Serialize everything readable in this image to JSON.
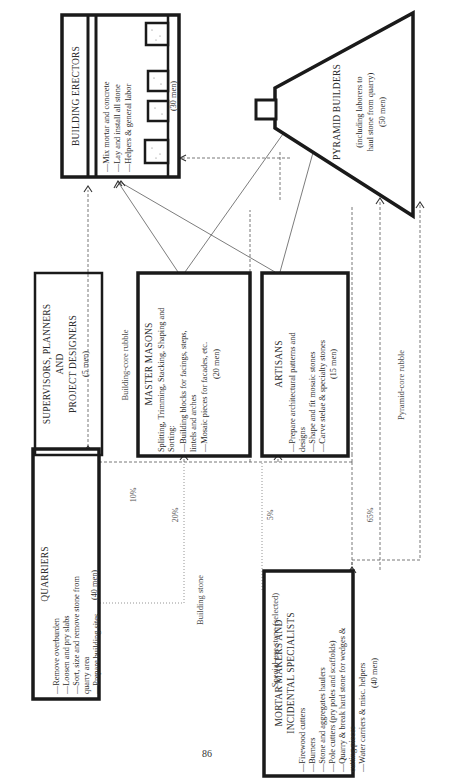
{
  "page_number": "86",
  "boxes": {
    "quarriers": {
      "title": "QUARRIERS",
      "items": [
        "—Remove overburden",
        "—Loosen and pry slabs",
        "—Sort, size and remove stone from",
        "   quarry area",
        "—Prepare building sites"
      ],
      "count": "(40 men)"
    },
    "mortar_makers": {
      "title_line1": "MORTAR MAKERS AND",
      "title_line2": "INCIDENTAL SPECIALISTS",
      "items": [
        "—Firewood cutters",
        "—Burners",
        "—Stone and aggregates haulers",
        "—Pole cutters (pry poles and scaffolds)",
        "—Quarry & break hard stone for wedges &",
        "   cutting pieces",
        "—Water carriers & misc. helpers"
      ],
      "count": "(40 men)"
    },
    "supervisors": {
      "title_line1": "SUPERVISORS, PLANNERS",
      "title_line2": "AND",
      "title_line3": "PROJECT DESIGNERS",
      "count": "(5 men)"
    },
    "master_masons": {
      "title": "MASTER MASONS",
      "intro_line1": "Splitting, Trimming, Stacking, Shaping and",
      "intro_line2": "Sorting:",
      "items": [
        "—Building blocks for facings, steps,",
        "   lintels and arches",
        "—Mosaic pieces for facades, etc."
      ],
      "count": "(20 men)"
    },
    "artisans": {
      "title": "ARTISANS",
      "items": [
        "—Prepare architectural patterns and",
        "   designs",
        "—Shape and fit mosaic stones",
        "—Carve stelae & specialty stones"
      ],
      "count": "(15 men)"
    },
    "building_erectors": {
      "title": "BUILDING ERECTORS",
      "items": [
        "—Mix mortar and concrete",
        "—Lay and install all stone",
        "—Helpers & general labor"
      ],
      "count": "(30 men)"
    },
    "pyramid_builders": {
      "title": "PYRAMID BUILDERS",
      "subtitle_line1": "(including laborers to",
      "subtitle_line2": "haul stone from quarry)",
      "count": "(50 men)"
    }
  },
  "flows": {
    "building_stone": "Building stone",
    "special_use_stone": "Special-use stone (selected)",
    "building_core_rubble": "Building-core rubble",
    "pyramid_core_rubble": "Pyramid-core rubble",
    "percentages": {
      "building_core": "10%",
      "masons": "20%",
      "artisans": "5%",
      "pyramid_core": "65%"
    }
  }
}
